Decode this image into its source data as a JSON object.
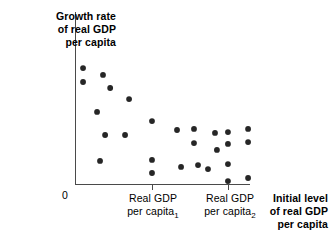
{
  "figure": {
    "y_axis_label": "Growth rate\nof real GDP\nper capita",
    "origin_label": "0",
    "x_axis_title": "Initial level\nof real GDP\nper capita",
    "x_tick_labels": [
      {
        "text": "Real GDP\nper capita",
        "subscript": "1"
      },
      {
        "text": "Real GDP\nper capita",
        "subscript": "2"
      }
    ],
    "colors": {
      "point": "#262626",
      "axis": "#4a4a4a",
      "background": "#ffffff",
      "text": "#000000"
    }
  },
  "chart_data": {
    "type": "scatter",
    "title": "",
    "xlabel": "Initial level of real GDP per capita",
    "ylabel": "Growth rate of real GDP per capita",
    "grid": false,
    "legend": false,
    "axis_origin_label": "0",
    "xlim": [
      0,
      100
    ],
    "ylim": [
      0,
      100
    ],
    "xticks": [
      44,
      88
    ],
    "xticklabels": [
      "Real GDP per capita 1",
      "Real GDP per capita 2"
    ],
    "points": [
      {
        "x": 4.6,
        "y": 67.4
      },
      {
        "x": 4.6,
        "y": 59.3
      },
      {
        "x": 16.0,
        "y": 63.4
      },
      {
        "x": 20.1,
        "y": 55.8
      },
      {
        "x": 12.6,
        "y": 41.9
      },
      {
        "x": 30.9,
        "y": 49.4
      },
      {
        "x": 17.2,
        "y": 28.5
      },
      {
        "x": 28.6,
        "y": 28.5
      },
      {
        "x": 44.0,
        "y": 36.6
      },
      {
        "x": 14.3,
        "y": 13.4
      },
      {
        "x": 44.0,
        "y": 14.0
      },
      {
        "x": 44.0,
        "y": 6.4
      },
      {
        "x": 58.3,
        "y": 31.4
      },
      {
        "x": 60.6,
        "y": 9.9
      },
      {
        "x": 68.0,
        "y": 32.0
      },
      {
        "x": 68.0,
        "y": 23.8
      },
      {
        "x": 70.3,
        "y": 11.0
      },
      {
        "x": 76.0,
        "y": 8.7
      },
      {
        "x": 80.0,
        "y": 29.7
      },
      {
        "x": 81.1,
        "y": 19.8
      },
      {
        "x": 87.4,
        "y": 11.6
      },
      {
        "x": 87.4,
        "y": 1.7
      },
      {
        "x": 87.4,
        "y": 30.2
      },
      {
        "x": 87.4,
        "y": 23.3
      },
      {
        "x": 98.9,
        "y": 32.0
      },
      {
        "x": 98.9,
        "y": 24.4
      },
      {
        "x": 98.9,
        "y": 3.5
      }
    ]
  },
  "geometry": {
    "plot_left": 75,
    "plot_right": 250,
    "plot_top": 12,
    "plot_bottom": 184,
    "point_radius": 2.9,
    "tick_length": 5
  }
}
